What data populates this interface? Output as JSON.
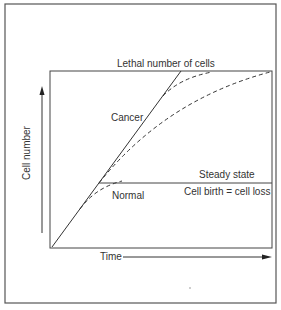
{
  "figure": {
    "title_top": "Lethal number of cells",
    "y_axis_label": "Cell number",
    "x_axis_label": "Time",
    "curves": {
      "cancer": "Cancer",
      "normal": "Normal"
    },
    "steady_state": {
      "label": "Steady state",
      "equation": "Cell birth = cell loss"
    }
  },
  "colors": {
    "line": "#333333",
    "frame": "#555555",
    "background": "#ffffff"
  }
}
